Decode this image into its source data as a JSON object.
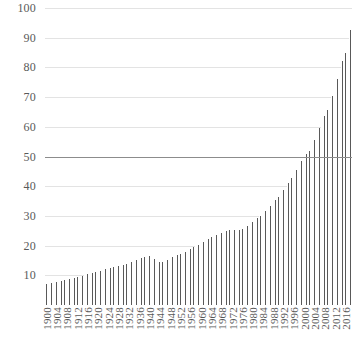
{
  "chart_data": {
    "type": "bar",
    "title": "",
    "subtitle": "",
    "xlabel": "",
    "ylabel": "",
    "ylim": [
      0,
      100
    ],
    "grid": true,
    "legend": null,
    "y_ticks": [
      100,
      90,
      80,
      70,
      60,
      50,
      40,
      30,
      20,
      10
    ],
    "emphasis_gridline": 50,
    "bar_color": "#595959",
    "gridline_color": "#e3e3e3",
    "emphasis_gridline_color": "#8c8c8c",
    "axis_text_color": "#595959",
    "background_color": "#ffffff",
    "x_tick_labels": [
      "1900",
      "1904",
      "1908",
      "1912",
      "1916",
      "1920",
      "1924",
      "1928",
      "1932",
      "1936",
      "1940",
      "1944",
      "1948",
      "1952",
      "1956",
      "1960",
      "1964",
      "1968",
      "1972",
      "1976",
      "1980",
      "1984",
      "1988",
      "1992",
      "1996",
      "2000",
      "2004",
      "2008",
      "2012",
      "2016"
    ],
    "x_tick_step": 4,
    "categories": [
      "1900",
      "1901",
      "1902",
      "1903",
      "1904",
      "1905",
      "1906",
      "1907",
      "1908",
      "1909",
      "1910",
      "1911",
      "1912",
      "1913",
      "1914",
      "1915",
      "1916",
      "1917",
      "1918",
      "1919",
      "1920",
      "1921",
      "1922",
      "1923",
      "1924",
      "1925",
      "1926",
      "1927",
      "1928",
      "1929",
      "1930",
      "1931",
      "1932",
      "1933",
      "1934",
      "1935",
      "1936",
      "1937",
      "1938",
      "1939",
      "1940",
      "1941",
      "1942",
      "1943",
      "1944",
      "1945",
      "1946",
      "1947",
      "1948",
      "1949",
      "1950",
      "1951",
      "1952",
      "1953",
      "1954",
      "1955",
      "1956",
      "1957",
      "1958",
      "1959",
      "1960",
      "1961",
      "1962",
      "1963",
      "1964",
      "1965",
      "1966",
      "1967",
      "1968",
      "1969",
      "1970",
      "1971",
      "1972",
      "1973",
      "1974",
      "1975",
      "1976",
      "1977",
      "1978",
      "1979",
      "1980",
      "1981",
      "1982",
      "1983",
      "1984",
      "1985",
      "1986",
      "1987",
      "1988",
      "1989",
      "1990",
      "1991",
      "1992",
      "1993",
      "1994",
      "1995",
      "1996",
      "1997",
      "1998",
      "1999",
      "2000",
      "2001",
      "2002",
      "2003",
      "2004",
      "2005",
      "2006",
      "2007",
      "2008",
      "2009",
      "2010",
      "2011",
      "2012",
      "2013",
      "2014",
      "2015",
      "2016",
      "2017",
      "2018"
    ],
    "values": [
      7.0,
      7.2,
      7.4,
      7.6,
      7.8,
      8.0,
      8.2,
      8.4,
      8.6,
      8.8,
      9.0,
      9.2,
      9.4,
      9.7,
      9.9,
      10.1,
      10.4,
      10.6,
      10.8,
      11.1,
      11.3,
      11.6,
      11.8,
      12.1,
      12.3,
      12.5,
      12.8,
      13.0,
      13.2,
      13.4,
      13.6,
      13.8,
      14.1,
      14.4,
      14.8,
      15.2,
      15.6,
      15.9,
      16.1,
      16.3,
      16.4,
      16.0,
      15.4,
      14.9,
      14.6,
      14.5,
      14.8,
      15.2,
      15.6,
      16.0,
      16.4,
      16.8,
      17.2,
      17.6,
      18.0,
      18.4,
      18.9,
      19.4,
      19.8,
      20.3,
      20.8,
      21.3,
      21.8,
      22.3,
      22.8,
      23.3,
      23.7,
      24.1,
      24.4,
      24.7,
      25.0,
      25.3,
      25.6,
      25.4,
      25.2,
      25.3,
      25.6,
      26.0,
      26.5,
      27.1,
      27.8,
      28.5,
      29.2,
      29.9,
      30.7,
      31.5,
      32.4,
      33.3,
      34.3,
      35.3,
      36.4,
      37.5,
      38.7,
      39.9,
      41.2,
      42.6,
      44.0,
      45.5,
      47.0,
      48.6,
      50.2,
      51.0,
      52.0,
      53.5,
      55.5,
      57.5,
      59.5,
      61.5,
      63.5,
      65.5,
      68.0,
      70.5,
      73.0,
      76.0,
      79.0,
      82.0,
      85.0,
      88.5,
      92.5
    ]
  }
}
